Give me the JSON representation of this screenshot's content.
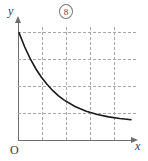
{
  "figure": {
    "number_label": "8",
    "background_color": "#ffffff",
    "axis_color": "#6d6d6d",
    "grid_color": "#a8a8a8",
    "curve_color": "#1a1a1a"
  },
  "labels": {
    "y_axis": "y",
    "x_axis": "x",
    "origin": "O"
  },
  "chart_data": {
    "type": "line",
    "title": "",
    "subtitle": "",
    "xlabel": "x",
    "ylabel": "y",
    "origin_label": "O",
    "annotations": [
      "8"
    ],
    "legend": [],
    "legend_position": "none",
    "grid": true,
    "grid_style": "dashed",
    "grid_vertical_count": 4,
    "grid_horizontal_count": 4,
    "axis_arrows": true,
    "xlim": [
      0,
      5
    ],
    "ylim": [
      0,
      5
    ],
    "xticks": [
      1,
      2,
      3,
      4
    ],
    "yticks": [
      1,
      2,
      3,
      4
    ],
    "xtick_labels": [],
    "ytick_labels": [],
    "series": [
      {
        "name": "decay-curve",
        "description": "decreasing exponential decay curve approaching horizontal asymptote",
        "x": [
          0.0,
          0.25,
          0.5,
          0.75,
          1.0,
          1.25,
          1.5,
          1.75,
          2.0,
          2.5,
          3.0,
          3.5,
          4.0,
          4.5,
          5.0
        ],
        "y": [
          4.55,
          3.95,
          3.45,
          3.02,
          2.66,
          2.36,
          2.1,
          1.88,
          1.7,
          1.42,
          1.22,
          1.08,
          0.98,
          0.91,
          0.86
        ]
      }
    ]
  }
}
